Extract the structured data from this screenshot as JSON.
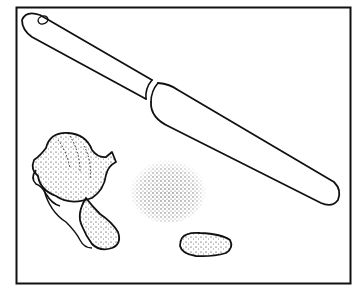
{
  "illustration": {
    "subject": "knife, garlic bulb, crushed garlic and garlic clove",
    "colors": {
      "ink": "#111111",
      "paper": "#ffffff"
    },
    "objects": [
      "frame",
      "knife",
      "garlic-bulb",
      "garlic-clove-attached",
      "crushed-garlic-pile",
      "peeled-clove"
    ]
  }
}
